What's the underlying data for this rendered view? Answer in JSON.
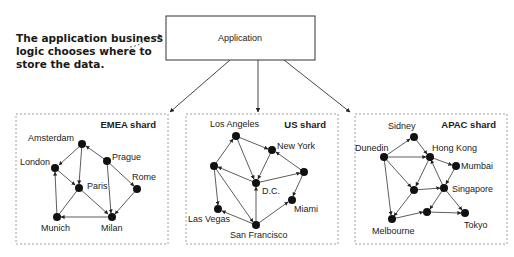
{
  "annotation": "The application business logic chooses where to store the data.",
  "application_box": {
    "label": "Application"
  },
  "shards": [
    {
      "label": "EMEA shard",
      "nodes": [
        {
          "name": "Amsterdam",
          "x": 82,
          "y": 144
        },
        {
          "name": "London",
          "x": 55,
          "y": 168
        },
        {
          "name": "Prague",
          "x": 107,
          "y": 161
        },
        {
          "name": "Paris",
          "x": 79,
          "y": 188
        },
        {
          "name": "Rome",
          "x": 137,
          "y": 189
        },
        {
          "name": "Munich",
          "x": 57,
          "y": 217
        },
        {
          "name": "Milan",
          "x": 112,
          "y": 217
        }
      ]
    },
    {
      "label": "US shard",
      "nodes": [
        {
          "name": "Los Angeles",
          "x": 236,
          "y": 136
        },
        {
          "name": "New York",
          "x": 272,
          "y": 150
        },
        {
          "name": "",
          "x": 214,
          "y": 166
        },
        {
          "name": "",
          "x": 304,
          "y": 172
        },
        {
          "name": "D.C.",
          "x": 256,
          "y": 183
        },
        {
          "name": "Miami",
          "x": 292,
          "y": 200
        },
        {
          "name": "Las Vegas",
          "x": 218,
          "y": 209
        },
        {
          "name": "San Francisco",
          "x": 256,
          "y": 225
        }
      ]
    },
    {
      "label": "APAC shard",
      "nodes": [
        {
          "name": "Sidney",
          "x": 414,
          "y": 137
        },
        {
          "name": "Dunedin",
          "x": 384,
          "y": 157
        },
        {
          "name": "Hong Kong",
          "x": 430,
          "y": 157
        },
        {
          "name": "Mumbai",
          "x": 456,
          "y": 166
        },
        {
          "name": "",
          "x": 414,
          "y": 190
        },
        {
          "name": "Singapore",
          "x": 444,
          "y": 188
        },
        {
          "name": "",
          "x": 427,
          "y": 212
        },
        {
          "name": "Melbourne",
          "x": 392,
          "y": 219
        },
        {
          "name": "Tokyo",
          "x": 465,
          "y": 213
        }
      ]
    }
  ]
}
